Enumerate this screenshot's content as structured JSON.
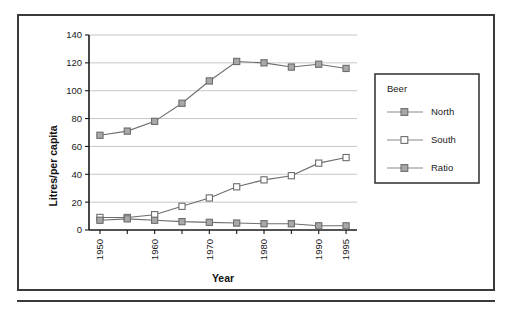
{
  "chart_data": {
    "type": "line",
    "title": "",
    "xlabel": "Year",
    "ylabel": "Litres/per capita",
    "x": [
      1950,
      1955,
      1960,
      1965,
      1970,
      1975,
      1980,
      1985,
      1990,
      1995
    ],
    "xtick_labels": [
      "1950",
      "1960",
      "1970",
      "1980",
      "1990",
      "1995"
    ],
    "xtick_values": [
      1950,
      1960,
      1970,
      1980,
      1990,
      1995
    ],
    "xlim": [
      1948,
      1997
    ],
    "ylim": [
      0,
      140
    ],
    "ytick_labels": [
      "0",
      "20",
      "40",
      "60",
      "80",
      "100",
      "120",
      "140"
    ],
    "ytick_values": [
      0,
      20,
      40,
      60,
      80,
      100,
      120,
      140
    ],
    "grid": true,
    "legend_position": "right",
    "legend_title": "Beer",
    "series": [
      {
        "name": "North",
        "marker": "filled-square",
        "color": "#a8a8a8",
        "values": [
          68,
          71,
          78,
          91,
          107,
          121,
          120,
          117,
          119,
          116
        ]
      },
      {
        "name": "South",
        "marker": "open-square",
        "color": "#ffffff",
        "values": [
          9,
          9,
          11,
          17,
          23,
          31,
          36,
          39,
          48,
          52
        ]
      },
      {
        "name": "Ratio",
        "marker": "filled-square",
        "color": "#a8a8a8",
        "values": [
          7,
          8,
          7,
          6,
          5.5,
          5,
          4.5,
          4.5,
          3,
          3
        ]
      }
    ]
  },
  "axes": {
    "y_title": "Litres/per capita",
    "x_title": "Year"
  },
  "legend": {
    "title": "Beer",
    "items": [
      {
        "label": "North"
      },
      {
        "label": "South"
      },
      {
        "label": "Ratio"
      }
    ]
  },
  "colors": {
    "frame": "#3a3a3a",
    "grid": "#b9b9b9",
    "line": "#6d6d6d",
    "marker_fill": "#a8a8a8",
    "marker_open": "#ffffff",
    "text": "#1a1a1a"
  }
}
